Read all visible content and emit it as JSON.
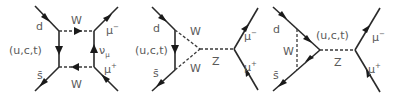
{
  "figure": {
    "colors": {
      "line": "#2a2a2a",
      "label": "#5a5a5a",
      "background": "#ffffff"
    },
    "diagrams": [
      {
        "name": "box-diagram",
        "labels": {
          "d": "d",
          "quarks": "(u,c,t)",
          "sbar": "s̄",
          "w_top": "W",
          "w_bottom": "W",
          "nu": "ν",
          "nu_sub": "μ",
          "mu_minus": "μ",
          "mu_minus_sup": "−",
          "mu_plus": "μ",
          "mu_plus_sup": "+"
        }
      },
      {
        "name": "z-penguin-w-loop",
        "labels": {
          "d": "d",
          "quarks": "(u,c,t)",
          "sbar": "s̄",
          "w_top": "W",
          "w_bottom": "W",
          "z": "Z",
          "mu_minus": "μ",
          "mu_minus_sup": "−",
          "mu_plus": "μ",
          "mu_plus_sup": "+"
        }
      },
      {
        "name": "z-penguin-quark-loop",
        "labels": {
          "d": "d",
          "w": "W",
          "quarks": "(u,c,t)",
          "sbar": "s̄",
          "z": "Z",
          "mu_minus": "μ",
          "mu_minus_sup": "−",
          "mu_plus": "μ",
          "mu_plus_sup": "+"
        }
      }
    ]
  }
}
